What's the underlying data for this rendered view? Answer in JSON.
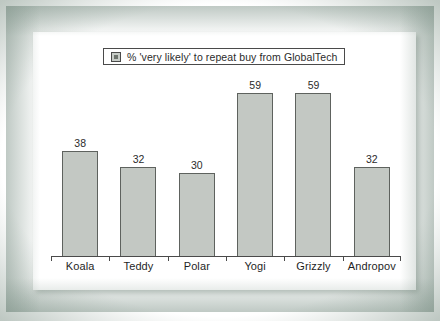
{
  "chart_data": {
    "type": "bar",
    "title": "",
    "subtitle": "",
    "xlabel": "",
    "ylabel": "",
    "ylim": [
      0,
      65
    ],
    "grid": false,
    "legend_position": "top-center",
    "categories": [
      "Koala",
      "Teddy",
      "Polar",
      "Yogi",
      "Grizzly",
      "Andropov"
    ],
    "values": [
      38,
      32,
      30,
      59,
      59,
      32
    ],
    "value_labels": [
      "38",
      "32",
      "30",
      "59",
      "59",
      "32"
    ],
    "series": [
      {
        "name": "% 'very likely' to repeat buy from GlobalTech",
        "values": [
          38,
          32,
          30,
          59,
          59,
          32
        ]
      }
    ],
    "legend": [
      {
        "marker": "square-swatch-icon",
        "label": "% 'very likely' to repeat buy from GlobalTech"
      }
    ],
    "colors": {
      "bar_fill": "#c3c8c3",
      "bar_border": "#5e625e",
      "axis": "#4a4a4a",
      "text": "#1f1f1f",
      "panel_background": "#ffffff",
      "frame": "#8a9c92"
    }
  },
  "figure": {
    "panel_name": "chart-panel",
    "frame_name": "scanned-border"
  }
}
